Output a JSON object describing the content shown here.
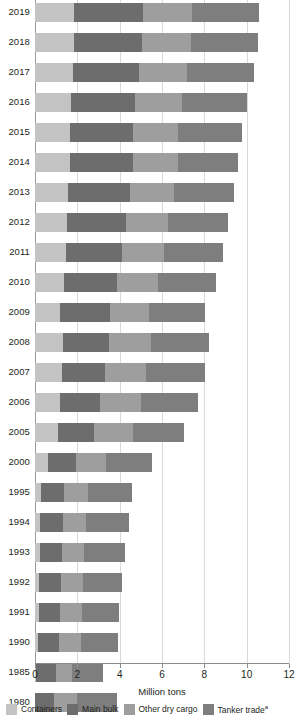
{
  "chart_data": {
    "type": "bar",
    "orientation": "horizontal",
    "stacked": true,
    "title": "",
    "xlabel": "Million tons",
    "ylabel": "",
    "xlim": [
      0,
      12
    ],
    "xticks": [
      0,
      2,
      4,
      6,
      8,
      10,
      12
    ],
    "grid": true,
    "legend_position": "bottom",
    "categories": [
      "2019",
      "2018",
      "2017",
      "2016",
      "2015",
      "2014",
      "2013",
      "2012",
      "2011",
      "2010",
      "2009",
      "2008",
      "2007",
      "2006",
      "2005",
      "2000",
      "1995",
      "1994",
      "1993",
      "1992",
      "1991",
      "1990",
      "1985",
      "1980"
    ],
    "series": [
      {
        "name": "Containers",
        "color": "#c3c3c3",
        "values": [
          1.86,
          1.83,
          1.78,
          1.7,
          1.66,
          1.63,
          1.56,
          1.51,
          1.45,
          1.35,
          1.19,
          1.34,
          1.29,
          1.19,
          1.08,
          0.62,
          0.29,
          0.25,
          0.22,
          0.2,
          0.18,
          0.16,
          0.07,
          0.0
        ]
      },
      {
        "name": "Main bulk",
        "color": "#6d6d6d",
        "values": [
          3.23,
          3.21,
          3.15,
          3.01,
          2.95,
          2.99,
          2.92,
          2.77,
          2.68,
          2.51,
          2.37,
          2.17,
          2.01,
          1.88,
          1.71,
          1.3,
          1.1,
          1.08,
          1.04,
          1.02,
          1.0,
          0.99,
          0.9,
          0.88
        ]
      },
      {
        "name": "Other dry cargo",
        "color": "#9e9e9e",
        "values": [
          2.34,
          2.31,
          2.27,
          2.23,
          2.16,
          2.12,
          2.08,
          2.02,
          1.97,
          1.93,
          1.81,
          1.99,
          1.96,
          1.92,
          1.83,
          1.43,
          1.12,
          1.09,
          1.07,
          1.05,
          1.03,
          1.01,
          0.78,
          1.12
        ]
      },
      {
        "name": "Tanker trade",
        "color": "#7e7e7e",
        "values": [
          3.17,
          3.19,
          3.15,
          3.06,
          3.02,
          2.83,
          2.84,
          2.84,
          2.8,
          2.75,
          2.64,
          2.74,
          2.75,
          2.7,
          2.42,
          2.16,
          2.05,
          2.0,
          1.94,
          1.86,
          1.76,
          1.76,
          1.46,
          1.87
        ]
      }
    ],
    "totals": [
      10.6,
      10.54,
      10.35,
      10.0,
      9.79,
      9.57,
      9.4,
      9.14,
      8.9,
      8.54,
      8.01,
      8.24,
      8.01,
      7.69,
      7.04,
      5.51,
      4.56,
      4.42,
      4.27,
      4.13,
      3.97,
      3.92,
      3.21,
      3.87
    ],
    "legend": [
      {
        "label": "Containers",
        "color": "#c3c3c3",
        "footnote": ""
      },
      {
        "label": "Main bulk",
        "color": "#6d6d6d",
        "footnote": ""
      },
      {
        "label": "Other dry cargo",
        "color": "#9e9e9e",
        "footnote": ""
      },
      {
        "label": "Tanker trade",
        "color": "#7e7e7e",
        "footnote": "a"
      }
    ]
  }
}
